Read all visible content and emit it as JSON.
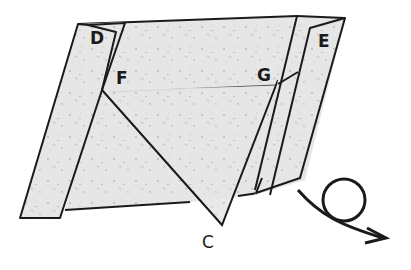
{
  "diagram": {
    "labels": {
      "D": "D",
      "E": "E",
      "F": "F",
      "G": "G",
      "C": "C"
    },
    "symbols": {
      "turn_over_arrow": "turn-over-icon"
    },
    "colors": {
      "paper": "#e6e6e6",
      "paper_speckle": "#b8b8b8",
      "outline": "#1a1a1a",
      "background": "#ffffff"
    }
  }
}
